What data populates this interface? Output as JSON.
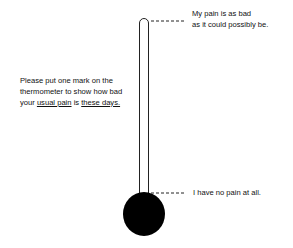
{
  "scale": {
    "top_anchor": [
      "My pain is as bad",
      "as it could possibly be."
    ],
    "bottom_anchor": "I have no pain at all."
  },
  "instruction": {
    "line1": "Please put one mark on the",
    "line2": "thermometer to show how bad",
    "line3_prefix": "your ",
    "line3_u1": "usual pain",
    "line3_mid": " is ",
    "line3_u2": "these days."
  },
  "colors": {
    "ink": "#111111",
    "background": "#ffffff"
  }
}
